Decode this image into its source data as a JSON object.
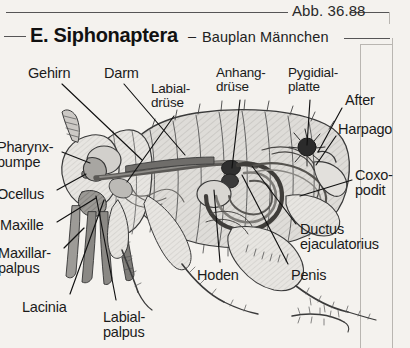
{
  "figure": {
    "number_label": "Abb. 36.88",
    "title_main": "E. Siphonaptera",
    "title_dash": "–",
    "title_sub": "Bauplan Männchen"
  },
  "colors": {
    "page_background": "#f4f2ee",
    "ink": "#1b1b1b",
    "frame": "#b9b6b1",
    "body_fill": "#dcdad6",
    "organ_dark": "#3a3a3a",
    "organ_mid": "#8e8c88",
    "gut_fill": "#6f6d6a",
    "leg_fill": "#e6e4e0"
  },
  "labels": [
    {
      "id": "gehirn",
      "text": "Gehirn",
      "x": 28,
      "y": 66,
      "size": 14.5,
      "lines": 1
    },
    {
      "id": "darm",
      "text": "Darm",
      "x": 104,
      "y": 66,
      "size": 14.5,
      "lines": 1
    },
    {
      "id": "labialdruese",
      "text": "Labial-\ndrüse",
      "x": 151,
      "y": 82,
      "size": 13.5,
      "lines": 2
    },
    {
      "id": "anhangdruese",
      "text": "Anhang-\ndrüse",
      "x": 216,
      "y": 66,
      "size": 13.5,
      "lines": 2
    },
    {
      "id": "pygidialplatte",
      "text": "Pygidial-\nplatte",
      "x": 288,
      "y": 66,
      "size": 13.5,
      "lines": 2
    },
    {
      "id": "after",
      "text": "After",
      "x": 345,
      "y": 93,
      "size": 14.5,
      "lines": 1
    },
    {
      "id": "harpago",
      "text": "Harpago",
      "x": 338,
      "y": 122,
      "size": 14.5,
      "lines": 1
    },
    {
      "id": "coxopodit",
      "text": "Coxo-\npodit",
      "x": 355,
      "y": 168,
      "size": 14.5,
      "lines": 2
    },
    {
      "id": "ductus",
      "text": "Ductus\nejaculatorius",
      "x": 300,
      "y": 222,
      "size": 14.5,
      "lines": 2
    },
    {
      "id": "penis",
      "text": "Penis",
      "x": 291,
      "y": 268,
      "size": 14.5,
      "lines": 1
    },
    {
      "id": "hoden",
      "text": "Hoden",
      "x": 197,
      "y": 268,
      "size": 14.5,
      "lines": 1
    },
    {
      "id": "labialpalpus",
      "text": "Labial-\npalpus",
      "x": 103,
      "y": 310,
      "size": 14.5,
      "lines": 2
    },
    {
      "id": "lacinia",
      "text": "Lacinia",
      "x": 22,
      "y": 300,
      "size": 14.5,
      "lines": 1
    },
    {
      "id": "maxillarpalpus",
      "text": "Maxillar-\npalpus",
      "x": -2,
      "y": 246,
      "size": 14.5,
      "lines": 2
    },
    {
      "id": "maxille",
      "text": "Maxille",
      "x": 0,
      "y": 218,
      "size": 14.5,
      "lines": 1
    },
    {
      "id": "ocellus",
      "text": "Ocellus",
      "x": -3,
      "y": 187,
      "size": 14.5,
      "lines": 1
    },
    {
      "id": "pharynxpumpe",
      "text": "Pharynx-\npumpe",
      "x": -3,
      "y": 140,
      "size": 14.5,
      "lines": 2
    }
  ],
  "leaders": [
    {
      "id": "leader-gehirn",
      "from": [
        62,
        84
      ],
      "to": [
        142,
        160
      ]
    },
    {
      "id": "leader-darm",
      "from": [
        124,
        84
      ],
      "to": [
        185,
        155
      ]
    },
    {
      "id": "leader-labialdruese",
      "from": [
        174,
        116
      ],
      "to": [
        127,
        182
      ]
    },
    {
      "id": "leader-anhangdruese",
      "from": [
        240,
        100
      ],
      "to": [
        232,
        168
      ]
    },
    {
      "id": "leader-pygidialplatte",
      "from": [
        310,
        100
      ],
      "to": [
        307,
        145
      ]
    },
    {
      "id": "leader-after",
      "from": [
        342,
        108
      ],
      "to": [
        318,
        152
      ]
    },
    {
      "id": "leader-harpago",
      "from": [
        336,
        136
      ],
      "to": [
        316,
        165
      ]
    },
    {
      "id": "leader-coxopodit",
      "from": [
        352,
        180
      ],
      "to": [
        300,
        196
      ]
    },
    {
      "id": "leader-ductus",
      "from": [
        296,
        224
      ],
      "to": [
        252,
        166
      ]
    },
    {
      "id": "leader-penis",
      "from": [
        288,
        264
      ],
      "to": [
        242,
        175
      ]
    },
    {
      "id": "leader-hoden",
      "from": [
        220,
        262
      ],
      "to": [
        214,
        190
      ]
    },
    {
      "id": "leader-labialpalpus",
      "from": [
        116,
        300
      ],
      "to": [
        96,
        196
      ]
    },
    {
      "id": "leader-lacinia",
      "from": [
        70,
        294
      ],
      "to": [
        104,
        200
      ]
    },
    {
      "id": "leader-maxillarpalpus",
      "from": [
        64,
        248
      ],
      "to": [
        84,
        228
      ]
    },
    {
      "id": "leader-maxille",
      "from": [
        57,
        222
      ],
      "to": [
        96,
        198
      ]
    },
    {
      "id": "leader-ocellus",
      "from": [
        57,
        190
      ],
      "to": [
        86,
        174
      ]
    },
    {
      "id": "leader-pharynxpumpe",
      "from": [
        62,
        152
      ],
      "to": [
        90,
        163
      ]
    }
  ],
  "anatomy_parts": [
    "head",
    "antenna",
    "brain",
    "pharyngeal-pump",
    "mouthparts",
    "maxilla",
    "maxillary-palpus",
    "labial-palpus",
    "lacinia",
    "thorax",
    "abdomen-segments",
    "gut",
    "labial-gland",
    "accessory-gland",
    "testis",
    "ductus-ejaculatorius",
    "penis-coil",
    "pygidial-plate",
    "anus",
    "harpago",
    "coxopodite",
    "fore-leg",
    "mid-leg",
    "hind-leg"
  ]
}
